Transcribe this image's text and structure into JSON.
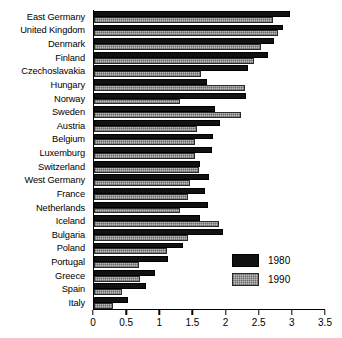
{
  "chart_data": {
    "type": "bar",
    "orientation": "horizontal",
    "title": "",
    "subtitle": "",
    "xlabel": "",
    "ylabel": "",
    "xlim": [
      0,
      3.5
    ],
    "xticks": [
      0,
      0.5,
      1,
      1.5,
      2,
      2.5,
      3,
      3.5
    ],
    "xtick_labels": [
      "0",
      "0.5",
      "1",
      "1.5",
      "2",
      "2.5",
      "3",
      "3.5"
    ],
    "grid": false,
    "legend_position": "inside-lower-right",
    "categories": [
      "East Germany",
      "United Kingdom",
      "Denmark",
      "Finland",
      "Czechoslavakia",
      "Hungary",
      "Norway",
      "Sweden",
      "Austria",
      "Belgium",
      "Luxemburg",
      "Switzerland",
      "West Germany",
      "France",
      "Netherlands",
      "Iceland",
      "Bulgaria",
      "Poland",
      "Portugal",
      "Greece",
      "Spain",
      "Italy"
    ],
    "series": [
      {
        "name": "1980",
        "color": "#111111",
        "values": [
          2.95,
          2.85,
          2.72,
          2.62,
          2.32,
          1.7,
          2.3,
          1.82,
          1.9,
          1.8,
          1.78,
          1.6,
          1.74,
          1.68,
          1.72,
          1.6,
          1.95,
          1.35,
          1.12,
          0.92,
          0.78,
          0.52
        ]
      },
      {
        "name": "1990",
        "color": "#b8b8b8",
        "values": [
          2.7,
          2.78,
          2.52,
          2.42,
          1.62,
          2.28,
          1.3,
          2.22,
          1.55,
          1.52,
          1.52,
          1.58,
          1.45,
          1.42,
          1.3,
          1.88,
          1.42,
          1.1,
          0.68,
          0.7,
          0.42,
          0.28
        ]
      }
    ]
  },
  "legend": {
    "entries": [
      {
        "label": "1980",
        "swatch": "solid-black-swatch"
      },
      {
        "label": "1990",
        "swatch": "hatched-gray-swatch"
      }
    ]
  }
}
